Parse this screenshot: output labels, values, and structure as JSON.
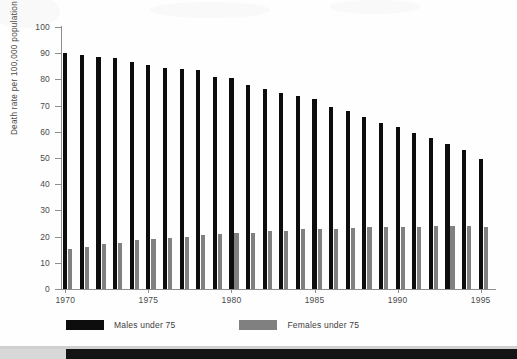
{
  "chart_data": {
    "type": "bar",
    "title": "",
    "subtitle": "",
    "xlabel": "",
    "ylabel": "Death rate per 100,000 population",
    "ylim": [
      0,
      100
    ],
    "yticks": [
      0,
      10,
      20,
      30,
      40,
      50,
      60,
      70,
      80,
      90,
      100
    ],
    "ytick_labels": [
      "0",
      "10",
      "20",
      "30",
      "40",
      "50",
      "60",
      "70",
      "80",
      "90",
      "100"
    ],
    "grid": false,
    "legend_position": "bottom-left",
    "categories": [
      "1970",
      "1971",
      "1972",
      "1973",
      "1974",
      "1975",
      "1976",
      "1977",
      "1978",
      "1979",
      "1980",
      "1981",
      "1982",
      "1983",
      "1984",
      "1985",
      "1986",
      "1987",
      "1988",
      "1989",
      "1990",
      "1991",
      "1992",
      "1993",
      "1994",
      "1995"
    ],
    "xtick_labels": [
      "1970",
      "1975",
      "1980",
      "1985",
      "1990",
      "1995"
    ],
    "xticks": [
      1970,
      1975,
      1980,
      1985,
      1990,
      1995
    ],
    "series": [
      {
        "name": "Males under 75",
        "color": "#0d0d0d",
        "values": [
          90.0,
          89.3,
          88.5,
          88.2,
          86.5,
          85.6,
          84.2,
          83.8,
          83.5,
          81.0,
          80.5,
          78.0,
          76.5,
          75.0,
          73.5,
          72.5,
          69.5,
          68.0,
          65.5,
          63.5,
          62.0,
          59.5,
          57.5,
          55.5,
          53.0,
          49.8
        ]
      },
      {
        "name": "Females under 75",
        "color": "#808080",
        "values": [
          15.3,
          16.0,
          17.0,
          17.6,
          18.6,
          19.0,
          19.6,
          20.0,
          20.6,
          21.0,
          21.2,
          21.5,
          22.0,
          22.3,
          22.8,
          23.0,
          23.0,
          23.3,
          23.5,
          23.6,
          23.8,
          23.8,
          23.9,
          23.9,
          23.9,
          23.8
        ]
      }
    ]
  },
  "legend": {
    "items": [
      {
        "label": "Males under 75",
        "color": "#0d0d0d",
        "swatch": "black-swatch"
      },
      {
        "label": "Females under 75",
        "color": "#808080",
        "swatch": "gray-swatch"
      }
    ]
  }
}
